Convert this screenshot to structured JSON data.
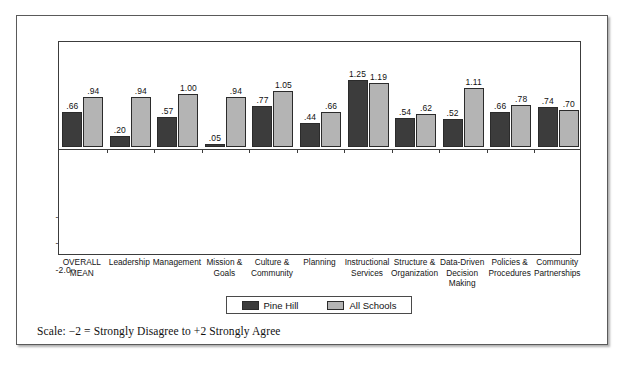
{
  "chart_data": {
    "type": "bar",
    "title": "",
    "xlabel": "",
    "ylabel": "",
    "ylim": [
      -2.0,
      2.0
    ],
    "yticks": [
      "2.0",
      "1.5",
      "1.0",
      ".5",
      ".0",
      "-.5",
      "-1.0",
      "-1.5",
      "-2.0"
    ],
    "ytick_values": [
      2.0,
      1.5,
      1.0,
      0.5,
      0.0,
      -0.5,
      -1.0,
      -1.5,
      -2.0
    ],
    "grid": false,
    "legend_position": "bottom-center",
    "categories": [
      "OVERALL\nMEAN",
      "Leadership",
      "Management",
      "Mission &\nGoals",
      "Culture &\nCommunity",
      "Planning",
      "Instructional\nServices",
      "Structure &\nOrganization",
      "Data-Driven\nDecision\nMaking",
      "Policies &\nProcedures",
      "Community\nPartnerships"
    ],
    "series": [
      {
        "name": "Pine Hill",
        "color": "#3c3c3c",
        "values": [
          0.66,
          0.2,
          0.57,
          0.05,
          0.77,
          0.44,
          1.25,
          0.54,
          0.52,
          0.66,
          0.74
        ],
        "labels": [
          ".66",
          ".20",
          ".57",
          ".05",
          ".77",
          ".44",
          "1.25",
          ".54",
          ".52",
          ".66",
          ".74"
        ]
      },
      {
        "name": "All Schools",
        "color": "#b4b4b4",
        "values": [
          0.94,
          0.94,
          1.0,
          0.94,
          1.05,
          0.66,
          1.19,
          0.62,
          1.11,
          0.78,
          0.7
        ],
        "labels": [
          ".94",
          ".94",
          "1.00",
          ".94",
          "1.05",
          ".66",
          "1.19",
          ".62",
          "1.11",
          ".78",
          ".70"
        ]
      }
    ]
  },
  "legend": {
    "entries": [
      {
        "label": "Pine Hill",
        "color": "#3c3c3c"
      },
      {
        "label": "All Schools",
        "color": "#b4b4b4"
      }
    ]
  },
  "footer": {
    "note": "Scale: −2 = Strongly Disagree to +2 Strongly Agree"
  }
}
